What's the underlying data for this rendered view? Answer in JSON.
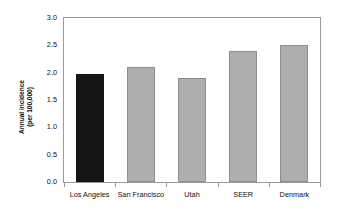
{
  "chart_data": {
    "type": "bar",
    "title": "",
    "subtitle": "",
    "xlabel": "",
    "ylabel": "Annual incidence (per 100,000)",
    "ylabel_line1": "Annual incidence",
    "ylabel_line2": "(per 100,000)",
    "categories": [
      "Los Angeles",
      "San Francisco",
      "Utah",
      "SEER",
      "Denmark"
    ],
    "values": [
      1.98,
      2.1,
      1.9,
      2.4,
      2.5
    ],
    "ylim": [
      0.0,
      3.0
    ],
    "ytick_values": [
      3.0,
      2.5,
      2.0,
      1.5,
      1.0,
      0.5,
      0.0
    ],
    "ytick_labels": [
      "3.0",
      "2.5",
      "2.0",
      "1.5",
      "1.0",
      "0.5",
      "0.0"
    ],
    "grid": false,
    "legend": "none",
    "bar_colors": [
      "#151515",
      "#aeaeae",
      "#aeaeae",
      "#aeaeae",
      "#aeaeae"
    ],
    "bar_edge_colors": [
      "#151515",
      "#8d8d8d",
      "#8d8d8d",
      "#8d8d8d",
      "#8d8d8d"
    ],
    "highlight_category": "Los Angeles",
    "frame_color": "#9a9a9a",
    "background_color": "#ffffff",
    "text_color": "#111111"
  }
}
